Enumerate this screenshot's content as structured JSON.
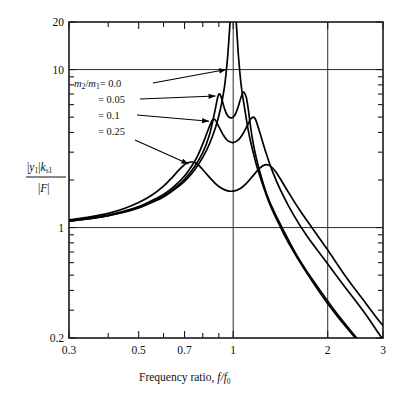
{
  "chart_data": {
    "type": "line",
    "title": "",
    "subtitle": "",
    "xlabel": "Frequency ratio, f/f0",
    "ylabel": "|y1|ks1 / |F|",
    "xscale": "log",
    "yscale": "log",
    "xlim": [
      0.3,
      3
    ],
    "ylim": [
      0.2,
      20
    ],
    "grid": true,
    "x_ticks": [
      0.3,
      0.5,
      0.7,
      1,
      2,
      3
    ],
    "x_tick_labels": [
      "0.3",
      "0.5",
      "0.7",
      "1",
      "2",
      "3"
    ],
    "y_ticks": [
      0.2,
      1,
      10,
      20
    ],
    "y_tick_labels": [
      "0.2",
      "1",
      "10",
      "20"
    ],
    "gridlines_x": [
      1,
      2
    ],
    "gridlines_y": [
      1,
      10
    ],
    "legend_position": "inside-upper-left",
    "series": [
      {
        "name": "0.0",
        "label": "m2/m1 =  0.0",
        "mass_ratio": 0.0,
        "x": [
          0.3,
          0.35,
          0.4,
          0.45,
          0.5,
          0.55,
          0.6,
          0.65,
          0.7,
          0.75,
          0.8,
          0.84,
          0.88,
          0.9,
          0.92,
          0.94,
          0.96,
          0.97,
          0.98,
          0.99,
          1.0,
          1.01,
          1.02,
          1.03,
          1.04,
          1.06,
          1.08,
          1.12,
          1.16,
          1.2,
          1.3,
          1.4,
          1.5,
          1.7,
          2.0,
          2.4,
          2.7,
          3.0
        ],
        "y": [
          1.1,
          1.14,
          1.19,
          1.25,
          1.33,
          1.44,
          1.56,
          1.74,
          1.96,
          2.29,
          2.78,
          3.38,
          4.35,
          5.1,
          6.2,
          8.0,
          12.0,
          16.0,
          22.0,
          40.0,
          60.0,
          40.0,
          22.0,
          16.0,
          12.0,
          8.0,
          6.2,
          4.0,
          2.95,
          2.3,
          1.45,
          1.05,
          0.8,
          0.53,
          0.33,
          0.21,
          0.165,
          0.13
        ]
      },
      {
        "name": "0.05",
        "label": "=  0.05",
        "mass_ratio": 0.05,
        "x": [
          0.3,
          0.35,
          0.4,
          0.45,
          0.5,
          0.55,
          0.6,
          0.65,
          0.7,
          0.75,
          0.8,
          0.84,
          0.87,
          0.89,
          0.9,
          0.91,
          0.92,
          0.94,
          0.96,
          0.98,
          1.0,
          1.02,
          1.04,
          1.06,
          1.08,
          1.1,
          1.11,
          1.12,
          1.13,
          1.15,
          1.18,
          1.22,
          1.28,
          1.35,
          1.45,
          1.6,
          1.8,
          2.1,
          2.5,
          2.8,
          3.0
        ],
        "y": [
          1.1,
          1.14,
          1.19,
          1.26,
          1.34,
          1.45,
          1.58,
          1.77,
          2.02,
          2.4,
          2.98,
          3.85,
          5.2,
          6.5,
          7.0,
          6.9,
          6.5,
          5.6,
          5.1,
          4.95,
          5.0,
          5.3,
          5.9,
          6.7,
          7.2,
          6.7,
          6.1,
          5.4,
          4.7,
          3.7,
          2.85,
          2.2,
          1.62,
          1.26,
          0.95,
          0.66,
          0.46,
          0.3,
          0.195,
          0.15,
          0.13
        ]
      },
      {
        "name": "0.1",
        "label": "=   0.1",
        "mass_ratio": 0.1,
        "x": [
          0.3,
          0.35,
          0.4,
          0.45,
          0.5,
          0.55,
          0.6,
          0.65,
          0.7,
          0.75,
          0.78,
          0.81,
          0.83,
          0.85,
          0.86,
          0.87,
          0.88,
          0.9,
          0.93,
          0.96,
          1.0,
          1.04,
          1.08,
          1.12,
          1.14,
          1.16,
          1.17,
          1.18,
          1.2,
          1.23,
          1.27,
          1.33,
          1.42,
          1.55,
          1.72,
          1.95,
          2.25,
          2.6,
          2.9,
          3.0
        ],
        "y": [
          1.1,
          1.15,
          1.2,
          1.27,
          1.36,
          1.48,
          1.62,
          1.83,
          2.12,
          2.58,
          3.0,
          3.6,
          4.1,
          4.6,
          4.8,
          4.85,
          4.75,
          4.35,
          3.85,
          3.55,
          3.45,
          3.6,
          4.0,
          4.6,
          4.9,
          5.0,
          4.95,
          4.8,
          4.35,
          3.7,
          3.0,
          2.3,
          1.7,
          1.22,
          0.88,
          0.63,
          0.43,
          0.295,
          0.215,
          0.195
        ]
      },
      {
        "name": "0.25",
        "label": "=  0.25",
        "mass_ratio": 0.25,
        "x": [
          0.3,
          0.35,
          0.4,
          0.45,
          0.5,
          0.55,
          0.6,
          0.64,
          0.67,
          0.7,
          0.72,
          0.74,
          0.76,
          0.78,
          0.82,
          0.86,
          0.9,
          0.95,
          1.0,
          1.05,
          1.1,
          1.15,
          1.2,
          1.24,
          1.27,
          1.3,
          1.33,
          1.37,
          1.42,
          1.5,
          1.62,
          1.78,
          2.0,
          2.3,
          2.65,
          2.9,
          3.0
        ],
        "y": [
          1.12,
          1.17,
          1.23,
          1.32,
          1.44,
          1.6,
          1.83,
          2.08,
          2.3,
          2.5,
          2.58,
          2.6,
          2.56,
          2.46,
          2.2,
          1.98,
          1.82,
          1.72,
          1.7,
          1.76,
          1.9,
          2.1,
          2.32,
          2.45,
          2.5,
          2.48,
          2.4,
          2.24,
          2.0,
          1.67,
          1.31,
          1.0,
          0.72,
          0.48,
          0.33,
          0.26,
          0.24
        ]
      }
    ],
    "annotations": [
      {
        "text": "m2/m1 =  0.0",
        "points_to": [
          1.0,
          10.0
        ]
      },
      {
        "text": "=  0.05",
        "points_to": [
          0.905,
          7.0
        ]
      },
      {
        "text": "=   0.1",
        "points_to": [
          0.865,
          4.85
        ]
      },
      {
        "text": "=  0.25",
        "points_to": [
          0.74,
          2.6
        ]
      }
    ]
  },
  "labels": {
    "y_axis": {
      "numerator_y": "y",
      "numerator_y_sub": "1",
      "numerator_k": "k",
      "numerator_k_sub": "s1",
      "denominator": "F"
    },
    "x_axis": {
      "prefix": "Frequency ratio,",
      "f": "f",
      "slash": "/",
      "f0": "f",
      "f0_sub": "0"
    },
    "legend": {
      "m_symbol": "m",
      "m2_sub": "2",
      "m1_sub": "1",
      "row1": "=  0.0",
      "row2": "=  0.05",
      "row3": "=   0.1",
      "row4": "=  0.25"
    }
  },
  "colors": {
    "curve": "#000000",
    "axis": "#1a1a1a",
    "grid": "#2b2b2b",
    "background": "#ffffff",
    "text": "#111111"
  }
}
